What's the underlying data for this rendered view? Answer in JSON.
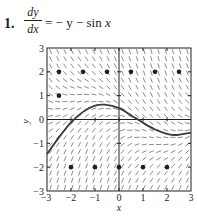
{
  "problem": {
    "number": "1.",
    "numerator": "dy",
    "denominator": "dx",
    "rhs_prefix": "= − y − sin ",
    "rhs_var": "x"
  },
  "chart_data": {
    "type": "slope_field",
    "equation": "dy/dx = -y - sin x",
    "xlabel": "x",
    "ylabel": "y",
    "xlim": [
      -3,
      3
    ],
    "ylim": [
      -3,
      3
    ],
    "x_ticks": [
      "−3",
      "−2",
      "−1",
      "0",
      "1",
      "2",
      "3"
    ],
    "y_ticks": [
      "−3",
      "−2",
      "−1",
      "0",
      "1",
      "2",
      "3"
    ],
    "solution_curve": [
      [
        -3,
        -1.45
      ],
      [
        -2.5,
        -0.75
      ],
      [
        -2,
        -0.12
      ],
      [
        -1.5,
        0.32
      ],
      [
        -1,
        0.58
      ],
      [
        -0.6,
        0.62
      ],
      [
        0,
        0.48
      ],
      [
        0.5,
        0.18
      ],
      [
        1,
        -0.14
      ],
      [
        1.5,
        -0.42
      ],
      [
        2,
        -0.6
      ],
      [
        2.4,
        -0.65
      ],
      [
        3,
        -0.55
      ]
    ],
    "points": [
      [
        -2.5,
        2
      ],
      [
        -1.5,
        2
      ],
      [
        -0.5,
        2
      ],
      [
        0.5,
        2
      ],
      [
        1.5,
        2
      ],
      [
        2.5,
        2
      ],
      [
        -2.5,
        1
      ],
      [
        -2,
        -2
      ],
      [
        -1,
        -2
      ],
      [
        0,
        -2
      ],
      [
        1,
        -2
      ],
      [
        2,
        -2
      ]
    ],
    "colors": {
      "ink": "#231f20",
      "field": "#6d6e70",
      "curve": "#3a3a3a"
    }
  }
}
